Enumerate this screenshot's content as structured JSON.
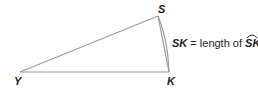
{
  "diagram": {
    "vertices": {
      "Y": {
        "label": "Y",
        "x": 20,
        "y": 72
      },
      "S": {
        "label": "S",
        "x": 158,
        "y": 16
      },
      "K": {
        "label": "K",
        "x": 169,
        "y": 72
      }
    },
    "segments": [
      "YS",
      "YK",
      "SK"
    ],
    "arcs": [
      {
        "from": "S",
        "to": "K",
        "bulge": "outward"
      }
    ],
    "annotation": {
      "lhs": "SK",
      "equals": " = length of ",
      "rhs": "SK",
      "rhs_has_arc": true
    },
    "colors": {
      "line": "#9a9a9a",
      "text": "#222222"
    }
  }
}
